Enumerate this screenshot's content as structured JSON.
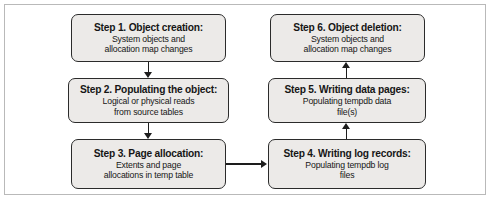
{
  "figure": {
    "name": "tempdb-object-lifecycle-flowchart",
    "border_color": "#b9b9b9",
    "node_fill": "#eceae8",
    "node_border": "#2b2b2b",
    "connector_color": "#1d1d1d"
  },
  "nodes": {
    "step1": {
      "title": "Step 1. Object creation:",
      "desc": "System objects and\nallocation map changes"
    },
    "step2": {
      "title": "Step 2. Populating the object:",
      "desc": "Logical or physical reads\nfrom source tables"
    },
    "step3": {
      "title": "Step 3. Page allocation:",
      "desc": "Extents and page\nallocations in temp table"
    },
    "step4": {
      "title": "Step 4. Writing log records:",
      "desc": "Populating tempdb log\nfiles"
    },
    "step5": {
      "title": "Step 5. Writing data pages:",
      "desc": "Populating tempdb data\nfile(s)"
    },
    "step6": {
      "title": "Step 6. Object deletion:",
      "desc": "System objects and\nallocation map changes"
    }
  },
  "connectors": [
    {
      "from": "step1",
      "to": "step2",
      "direction": "down"
    },
    {
      "from": "step2",
      "to": "step3",
      "direction": "down"
    },
    {
      "from": "step3",
      "to": "step4",
      "direction": "right"
    },
    {
      "from": "step4",
      "to": "step5",
      "direction": "up"
    },
    {
      "from": "step5",
      "to": "step6",
      "direction": "up"
    }
  ]
}
